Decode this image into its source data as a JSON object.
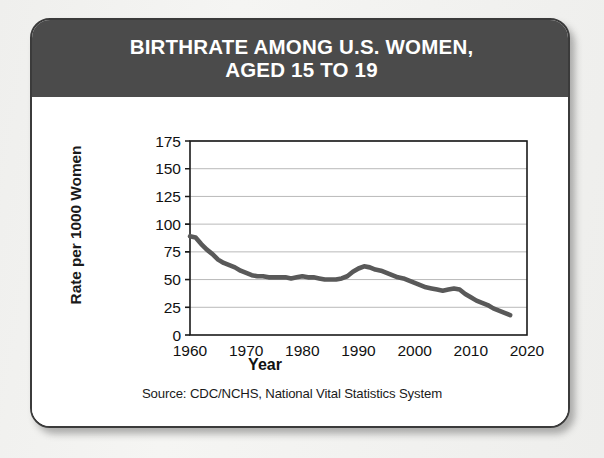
{
  "card": {
    "header_title": "BIRTHRATE AMONG U.S. WOMEN,\nAGED 15 TO 19",
    "source_note": "Source: CDC/NCHS, National Vital Statistics System"
  },
  "colors": {
    "header_bg": "#4b4b4b",
    "header_text": "#ffffff",
    "card_bg": "#ffffff",
    "card_border": "#3b3b3b",
    "page_bg": "#f2f2f0",
    "line": "#595959",
    "grid": "#b9b9b9",
    "axis": "#1a1a1a"
  },
  "chart_data": {
    "type": "line",
    "title": "BIRTHRATE AMONG U.S. WOMEN, AGED 15 TO 19",
    "xlabel": "Year",
    "ylabel": "Rate per 1000 Women",
    "xlim": [
      1960,
      2020
    ],
    "ylim": [
      0,
      175
    ],
    "xticks": [
      1960,
      1970,
      1980,
      1990,
      2000,
      2010,
      2020
    ],
    "xtick_labels": [
      "1960",
      "1970",
      "1980",
      "1990",
      "2000",
      "2010",
      "2020"
    ],
    "yticks": [
      0,
      25,
      50,
      75,
      100,
      125,
      150,
      175
    ],
    "ytick_labels": [
      "0",
      "25",
      "50",
      "75",
      "100",
      "125",
      "150",
      "175"
    ],
    "grid": "horizontal",
    "legend": "none",
    "source": "Source: CDC/NCHS, National Vital Statistics System",
    "series": [
      {
        "name": "Birthrate, women aged 15 to 19",
        "x": [
          1960,
          1961,
          1962,
          1963,
          1964,
          1965,
          1966,
          1967,
          1968,
          1969,
          1970,
          1971,
          1972,
          1973,
          1974,
          1975,
          1976,
          1977,
          1978,
          1979,
          1980,
          1981,
          1982,
          1983,
          1984,
          1985,
          1986,
          1987,
          1988,
          1989,
          1990,
          1991,
          1992,
          1993,
          1994,
          1995,
          1996,
          1997,
          1998,
          1999,
          2000,
          2001,
          2002,
          2003,
          2004,
          2005,
          2006,
          2007,
          2008,
          2009,
          2010,
          2011,
          2012,
          2013,
          2014,
          2015,
          2016,
          2017
        ],
        "y": [
          89,
          88,
          82,
          77,
          73,
          68,
          65,
          63,
          61,
          58,
          56,
          54,
          53,
          53,
          52,
          52,
          52,
          52,
          51,
          52,
          53,
          52,
          52,
          51,
          50,
          50,
          50,
          51,
          53,
          57,
          60,
          62,
          61,
          59,
          58,
          56,
          54,
          52,
          51,
          49,
          47,
          45,
          43,
          42,
          41,
          40,
          41,
          42,
          41,
          37,
          34,
          31,
          29,
          27,
          24,
          22,
          20,
          18
        ]
      }
    ],
    "annotations": [
      {
        "label": "1960 start",
        "x": 1960,
        "y": 89
      },
      {
        "label": "early-1990s peak",
        "x": 1991,
        "y": 62
      },
      {
        "label": "series end",
        "x": 2017,
        "y": 26
      }
    ]
  }
}
